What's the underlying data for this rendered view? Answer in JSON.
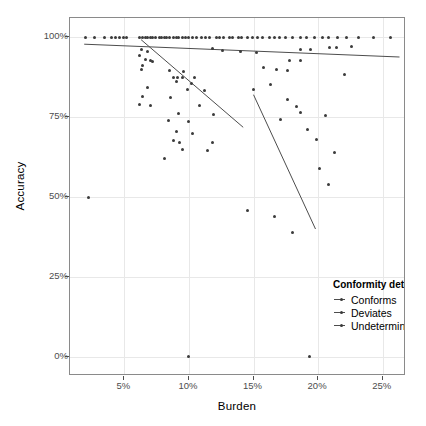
{
  "chart_data": {
    "type": "scatter",
    "title": "",
    "xlabel": "Burden",
    "ylabel": "Accuracy",
    "xlim": [
      0.008,
      0.268
    ],
    "ylim": [
      -0.06,
      1.06
    ],
    "grid": true,
    "xticks": [
      "5%",
      "10%",
      "15%",
      "20%",
      "25%"
    ],
    "xtick_values": [
      0.05,
      0.1,
      0.15,
      0.2,
      0.25
    ],
    "yticks": [
      "0%",
      "25%",
      "50%",
      "75%",
      "100%"
    ],
    "ytick_values": [
      0.0,
      0.25,
      0.5,
      0.75,
      1.0
    ],
    "legend": {
      "title": "Conformity determination",
      "position": "inside-bottom-right",
      "entries": [
        {
          "label": "Conforms",
          "color": "#4d4d4d"
        },
        {
          "label": "Deviates",
          "color": "#4d4d4d"
        },
        {
          "label": "Undetermined",
          "color": "#4d4d4d"
        }
      ]
    },
    "colors": {
      "point": "#3b3b3b",
      "trendline": "#4d4d4d",
      "gridline": "#e8e8e8",
      "panel_border": "#8a8a8a",
      "background": "#ffffff",
      "axis_text": "#4d4d4d",
      "title_text": "#000000"
    },
    "series": [
      {
        "name": "Conforms",
        "points": [
          [
            0.02,
            1.0
          ],
          [
            0.027,
            1.0
          ],
          [
            0.035,
            1.0
          ],
          [
            0.04,
            1.0
          ],
          [
            0.043,
            1.0
          ],
          [
            0.046,
            1.0
          ],
          [
            0.049,
            1.0
          ],
          [
            0.052,
            1.0
          ],
          [
            0.062,
            1.0
          ],
          [
            0.064,
            1.0
          ],
          [
            0.066,
            1.0
          ],
          [
            0.068,
            1.0
          ],
          [
            0.07,
            1.0
          ],
          [
            0.072,
            1.0
          ],
          [
            0.074,
            1.0
          ],
          [
            0.077,
            1.0
          ],
          [
            0.079,
            1.0
          ],
          [
            0.081,
            1.0
          ],
          [
            0.083,
            1.0
          ],
          [
            0.085,
            1.0
          ],
          [
            0.088,
            1.0
          ],
          [
            0.09,
            1.0
          ],
          [
            0.092,
            1.0
          ],
          [
            0.095,
            1.0
          ],
          [
            0.097,
            1.0
          ],
          [
            0.1,
            1.0
          ],
          [
            0.103,
            1.0
          ],
          [
            0.106,
            1.0
          ],
          [
            0.11,
            1.0
          ],
          [
            0.113,
            1.0
          ],
          [
            0.116,
            1.0
          ],
          [
            0.121,
            1.0
          ],
          [
            0.124,
            1.0
          ],
          [
            0.127,
            1.0
          ],
          [
            0.131,
            1.0
          ],
          [
            0.134,
            1.0
          ],
          [
            0.138,
            1.0
          ],
          [
            0.141,
            1.0
          ],
          [
            0.145,
            1.0
          ],
          [
            0.149,
            1.0
          ],
          [
            0.153,
            1.0
          ],
          [
            0.157,
            1.0
          ],
          [
            0.162,
            1.0
          ],
          [
            0.166,
            1.0
          ],
          [
            0.17,
            1.0
          ],
          [
            0.175,
            1.0
          ],
          [
            0.18,
            1.0
          ],
          [
            0.186,
            1.0
          ],
          [
            0.191,
            1.0
          ],
          [
            0.197,
            1.0
          ],
          [
            0.203,
            1.0
          ],
          [
            0.208,
            1.0
          ],
          [
            0.215,
            1.0
          ],
          [
            0.222,
            1.0
          ],
          [
            0.231,
            1.0
          ],
          [
            0.243,
            1.0
          ],
          [
            0.256,
            1.0
          ],
          [
            0.118,
            0.965
          ],
          [
            0.126,
            0.96
          ],
          [
            0.14,
            0.955
          ],
          [
            0.152,
            0.952
          ],
          [
            0.186,
            0.963
          ],
          [
            0.194,
            0.962
          ],
          [
            0.209,
            0.968
          ],
          [
            0.214,
            0.967
          ],
          [
            0.226,
            0.97
          ],
          [
            0.178,
            0.928
          ],
          [
            0.186,
            0.926
          ],
          [
            0.168,
            0.9
          ],
          [
            0.176,
            0.897
          ],
          [
            0.22,
            0.882
          ]
        ],
        "trendline": {
          "x0": 0.019,
          "y0": 0.978,
          "x1": 0.263,
          "y1": 0.938
        }
      },
      {
        "name": "Deviates",
        "points": [
          [
            0.063,
            0.962
          ],
          [
            0.068,
            0.955
          ],
          [
            0.062,
            0.944
          ],
          [
            0.066,
            0.93
          ],
          [
            0.07,
            0.928
          ],
          [
            0.072,
            0.925
          ],
          [
            0.064,
            0.913
          ],
          [
            0.063,
            0.898
          ],
          [
            0.085,
            0.895
          ],
          [
            0.096,
            0.892
          ],
          [
            0.088,
            0.875
          ],
          [
            0.091,
            0.874
          ],
          [
            0.095,
            0.874
          ],
          [
            0.104,
            0.873
          ],
          [
            0.09,
            0.86
          ],
          [
            0.102,
            0.855
          ],
          [
            0.068,
            0.842
          ],
          [
            0.099,
            0.838
          ],
          [
            0.112,
            0.833
          ],
          [
            0.064,
            0.815
          ],
          [
            0.086,
            0.812
          ],
          [
            0.062,
            0.79
          ],
          [
            0.07,
            0.786
          ],
          [
            0.108,
            0.785
          ],
          [
            0.092,
            0.762
          ],
          [
            0.119,
            0.758
          ],
          [
            0.084,
            0.74
          ],
          [
            0.1,
            0.735
          ],
          [
            0.09,
            0.705
          ],
          [
            0.103,
            0.7
          ],
          [
            0.088,
            0.678
          ],
          [
            0.093,
            0.67
          ],
          [
            0.118,
            0.672
          ],
          [
            0.095,
            0.65
          ],
          [
            0.114,
            0.645
          ],
          [
            0.081,
            0.62
          ],
          [
            0.022,
            0.5
          ],
          [
            0.145,
            0.458
          ],
          [
            0.166,
            0.44
          ],
          [
            0.18,
            0.39
          ],
          [
            0.1,
            0.0
          ],
          [
            0.193,
            0.0
          ]
        ],
        "trendline": {
          "x0": 0.063,
          "y0": 0.992,
          "x1": 0.142,
          "y1": 0.718
        }
      },
      {
        "name": "Undetermined",
        "points": [
          [
            0.158,
            0.905
          ],
          [
            0.163,
            0.852
          ],
          [
            0.15,
            0.838
          ],
          [
            0.176,
            0.805
          ],
          [
            0.183,
            0.782
          ],
          [
            0.186,
            0.765
          ],
          [
            0.206,
            0.755
          ],
          [
            0.171,
            0.742
          ],
          [
            0.192,
            0.712
          ],
          [
            0.199,
            0.68
          ],
          [
            0.213,
            0.64
          ],
          [
            0.201,
            0.588
          ],
          [
            0.208,
            0.54
          ]
        ],
        "trendline": {
          "x0": 0.15,
          "y0": 0.82,
          "x1": 0.198,
          "y1": 0.4
        }
      }
    ]
  }
}
